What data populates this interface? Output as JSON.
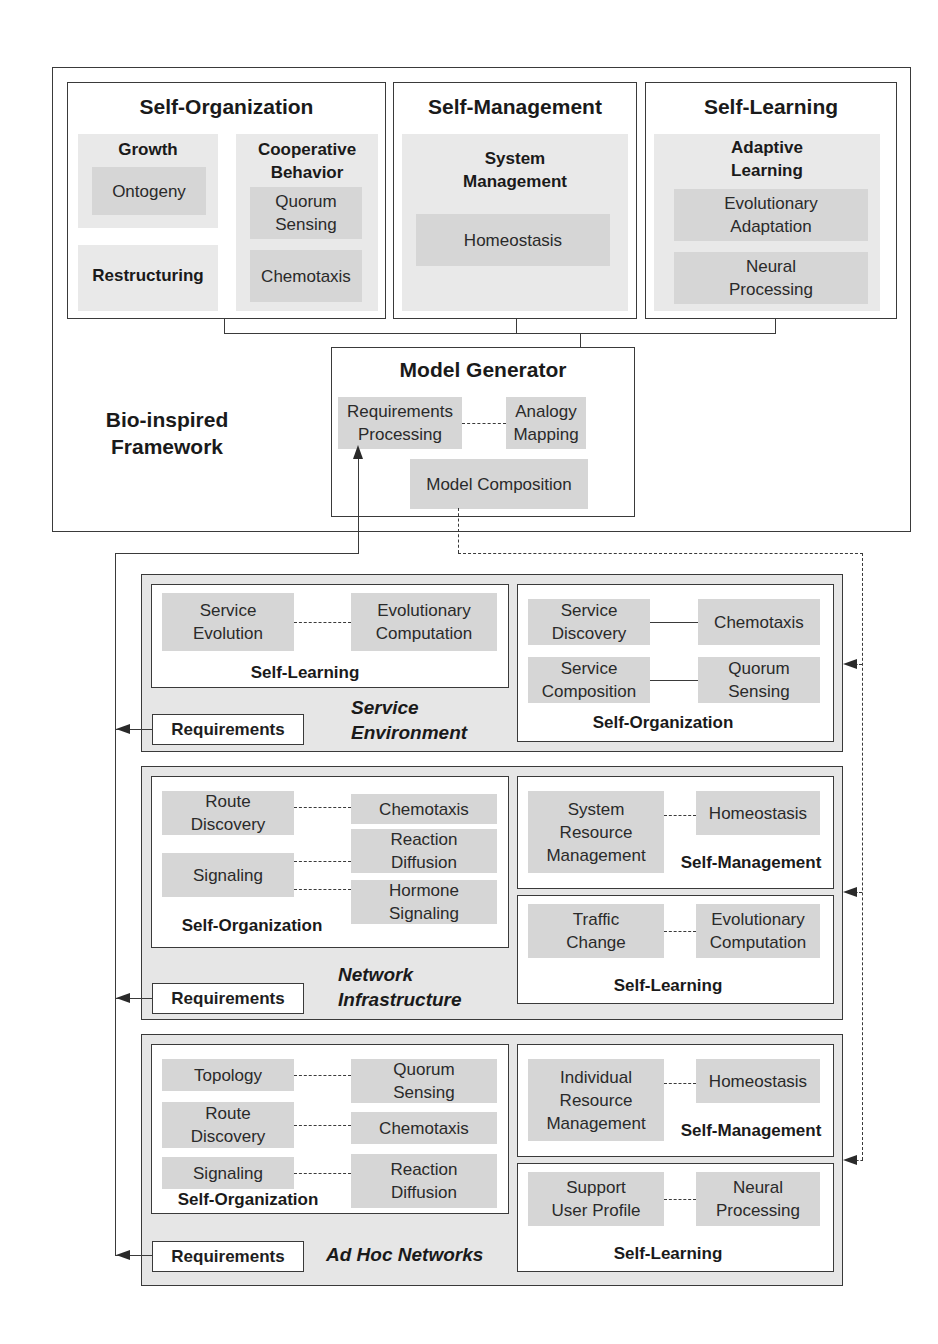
{
  "framework": {
    "label": "Bio-inspired\nFramework",
    "self_organization": {
      "title": "Self-Organization",
      "growth": {
        "title": "Growth",
        "item": "Ontogeny"
      },
      "restructuring": {
        "title": "Restructuring"
      },
      "cooperative": {
        "title": "Cooperative\nBehavior",
        "items": [
          "Quorum\nSensing",
          "Chemotaxis"
        ]
      }
    },
    "self_management": {
      "title": "Self-Management",
      "group": {
        "title": "System\nManagement",
        "item": "Homeostasis"
      }
    },
    "self_learning": {
      "title": "Self-Learning",
      "group": {
        "title": "Adaptive\nLearning",
        "items": [
          "Evolutionary\nAdaptation",
          "Neural\nProcessing"
        ]
      }
    },
    "model_generator": {
      "title": "Model Generator",
      "requirements_processing": "Requirements\nProcessing",
      "analogy_mapping": "Analogy\nMapping",
      "model_composition": "Model Composition"
    }
  },
  "layers": [
    {
      "name": "Service\nEnvironment",
      "requirements": "Requirements",
      "left": {
        "title": "Self-Learning",
        "pairs": [
          [
            "Service\nEvolution",
            "Evolutionary\nComputation"
          ]
        ]
      },
      "right": {
        "title": "Self-Organization",
        "pairs": [
          [
            "Service\nDiscovery",
            "Chemotaxis"
          ],
          [
            "Service\nComposition",
            "Quorum\nSensing"
          ]
        ]
      }
    },
    {
      "name": "Network\nInfrastructure",
      "requirements": "Requirements",
      "left": {
        "title": "Self-Organization",
        "sources": [
          "Route\nDiscovery",
          "Signaling"
        ],
        "targets": [
          "Chemotaxis",
          "Reaction\nDiffusion",
          "Hormone\nSignaling"
        ]
      },
      "right_top": {
        "title": "Self-Management",
        "pairs": [
          [
            "System\nResource\nManagement",
            "Homeostasis"
          ]
        ]
      },
      "right_bottom": {
        "title": "Self-Learning",
        "pairs": [
          [
            "Traffic\nChange",
            "Evolutionary\nComputation"
          ]
        ]
      }
    },
    {
      "name": "Ad Hoc Networks",
      "requirements": "Requirements",
      "left": {
        "title": "Self-Organization",
        "pairs": [
          [
            "Topology",
            "Quorum\nSensing"
          ],
          [
            "Route\nDiscovery",
            "Chemotaxis"
          ],
          [
            "Signaling",
            "Reaction\nDiffusion"
          ]
        ]
      },
      "right_top": {
        "title": "Self-Management",
        "pairs": [
          [
            "Individual\nResource\nManagement",
            "Homeostasis"
          ]
        ]
      },
      "right_bottom": {
        "title": "Self-Learning",
        "pairs": [
          [
            "Support\nUser Profile",
            "Neural\nProcessing"
          ]
        ]
      }
    }
  ],
  "colors": {
    "line": "#3a3a3a",
    "chip_fill": "#d6d6d6",
    "panel_fill": "#e6e6e6",
    "group_fill": "#e9e9e9"
  }
}
